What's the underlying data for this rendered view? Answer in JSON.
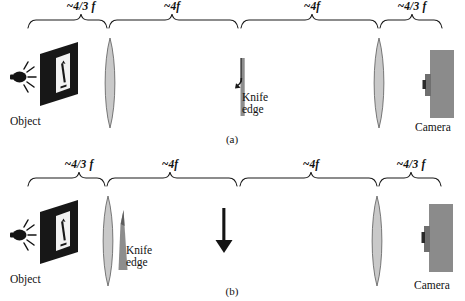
{
  "figure": {
    "colors": {
      "plate": "#1b1b1b",
      "lens_fill": "#c9c9c9",
      "lens_stroke": "#5e5e5e",
      "knife_gray": "#8b8b8b",
      "knife_dark": "#6f6f6f",
      "camera_body": "#8b8b8b",
      "camera_lens": "#6f6f6f",
      "ink": "#111111",
      "arrow_white": "#f2f2f2",
      "background": "#ffffff"
    }
  },
  "panels": [
    {
      "tag": "(a)",
      "segments": [
        {
          "label": "~4/3 f",
          "x_center": 81,
          "x_start": 28,
          "x_end": 107
        },
        {
          "label": "~4f",
          "x_center": 172,
          "x_start": 109,
          "x_end": 238
        },
        {
          "label": "~4f",
          "x_center": 312,
          "x_start": 241,
          "x_end": 378
        },
        {
          "label": "~4/3 f",
          "x_center": 412,
          "x_start": 380,
          "x_end": 442
        }
      ],
      "elements": {
        "light_source": {
          "name": "light-bulb",
          "x": 10,
          "y": 62
        },
        "object_plate": {
          "name": "object-plate",
          "x": 38,
          "y": 45,
          "arrow": "up"
        },
        "object_label": {
          "text": "Object",
          "x": 33,
          "y": 116
        },
        "lens_1": {
          "name": "lens",
          "x": 100,
          "y": 38
        },
        "knife_edge": {
          "name": "knife-edge",
          "x": 236,
          "y": 62
        },
        "knife_label": {
          "text_line1": "Knife",
          "text_line2": "edge",
          "x": 244,
          "y": 95
        },
        "lens_2": {
          "name": "lens",
          "x": 369,
          "y": 38
        },
        "camera": {
          "name": "camera",
          "x": 424,
          "y": 52
        },
        "camera_label": {
          "text": "Camera",
          "x": 420,
          "y": 122
        }
      }
    },
    {
      "tag": "(b)",
      "segments": [
        {
          "label": "~4/3 f",
          "x_center": 78,
          "x_start": 28,
          "x_end": 105
        },
        {
          "label": "~4f",
          "x_center": 170,
          "x_start": 107,
          "x_end": 237
        },
        {
          "label": "~4f",
          "x_center": 311,
          "x_start": 240,
          "x_end": 377
        },
        {
          "label": "~4/3 f",
          "x_center": 411,
          "x_start": 379,
          "x_end": 441
        }
      ],
      "elements": {
        "light_source": {
          "name": "light-bulb",
          "x": 10,
          "y": 66
        },
        "object_plate": {
          "name": "object-plate",
          "x": 38,
          "y": 49,
          "arrow": "up"
        },
        "object_label": {
          "text": "Object",
          "x": 33,
          "y": 118
        },
        "lens_1": {
          "name": "lens",
          "x": 98,
          "y": 40
        },
        "knife_edge": {
          "name": "knife-edge",
          "x": 116,
          "y": 58
        },
        "knife_label": {
          "text_line1": "Knife",
          "text_line2": "edge",
          "x": 128,
          "y": 92
        },
        "beam_arrow": {
          "name": "down-arrow",
          "x": 215,
          "y": 55
        },
        "lens_2": {
          "name": "lens",
          "x": 367,
          "y": 40
        },
        "camera": {
          "name": "camera",
          "x": 423,
          "y": 48
        },
        "camera_label": {
          "text": "Camera",
          "x": 419,
          "y": 122
        }
      }
    }
  ]
}
